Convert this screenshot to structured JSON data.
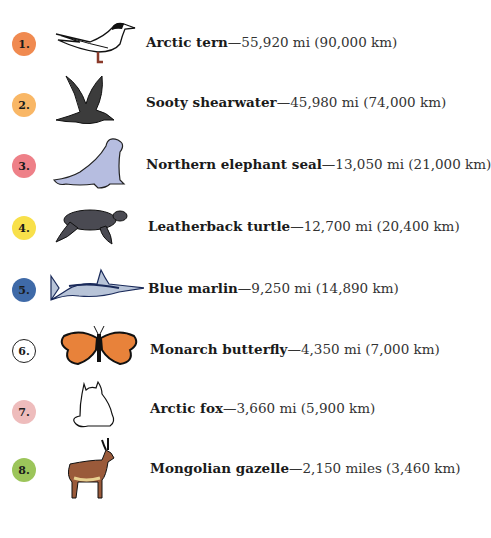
{
  "items": [
    {
      "rank": "1.",
      "name": "Arctic tern",
      "distance": "—55,920 mi (90,000 km)",
      "badge_color": "#f08a50",
      "icon": "arctic-tern-icon"
    },
    {
      "rank": "2.",
      "name": "Sooty shearwater",
      "distance": "—45,980 mi (74,000 km)",
      "badge_color": "#f9b766",
      "icon": "sooty-shearwater-icon"
    },
    {
      "rank": "3.",
      "name": "Northern elephant seal",
      "distance": "—13,050 mi (21,000 km)",
      "badge_color": "#ee8088",
      "icon": "elephant-seal-icon"
    },
    {
      "rank": "4.",
      "name": "Leatherback turtle",
      "distance": "—12,700 mi (20,400 km)",
      "badge_color": "#f8e04a",
      "icon": "leatherback-turtle-icon"
    },
    {
      "rank": "5.",
      "name": "Blue marlin",
      "distance": "—9,250 mi (14,890 km)",
      "badge_color": "#3f6aa8",
      "icon": "blue-marlin-icon"
    },
    {
      "rank": "6.",
      "name": "Monarch butterfly",
      "distance": "—4,350 mi (7,000 km)",
      "badge_color": "#ffffff",
      "icon": "monarch-butterfly-icon"
    },
    {
      "rank": "7.",
      "name": "Arctic fox",
      "distance": "—3,660 mi (5,900 km)",
      "badge_color": "#eebcbc",
      "icon": "arctic-fox-icon"
    },
    {
      "rank": "8.",
      "name": "Mongolian gazelle",
      "distance": "—2,150 miles (3,460 km)",
      "badge_color": "#9cc55a",
      "icon": "mongolian-gazelle-icon"
    }
  ]
}
